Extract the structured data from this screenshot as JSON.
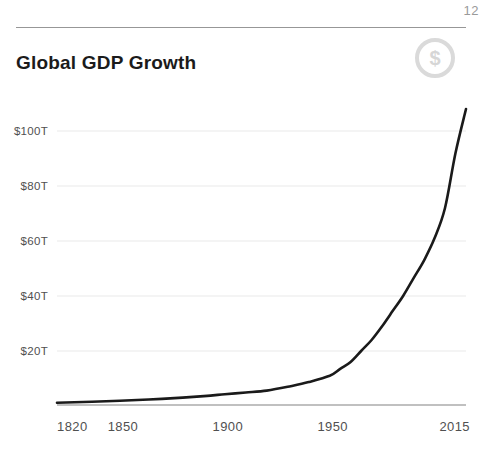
{
  "header": {
    "page_number": "12",
    "title": "Global GDP Growth",
    "dollar_icon_glyph": "$"
  },
  "chart_data": {
    "type": "line",
    "title": "Global GDP Growth",
    "x": [
      1820,
      1850,
      1870,
      1890,
      1900,
      1910,
      1920,
      1930,
      1940,
      1950,
      1955,
      1960,
      1965,
      1970,
      1975,
      1980,
      1985,
      1990,
      1995,
      2000,
      2005,
      2010,
      2015
    ],
    "series": [
      {
        "name": "Global GDP (trillions USD)",
        "values": [
          1.2,
          1.9,
          2.6,
          3.6,
          4.3,
          4.9,
          5.6,
          7.0,
          8.7,
          11,
          13.5,
          16,
          20,
          24,
          29,
          34.5,
          40,
          46.5,
          53,
          61,
          72,
          92,
          108
        ]
      }
    ],
    "xlim": [
      1820,
      2015
    ],
    "ylim": [
      0,
      110
    ],
    "yticks": [
      20,
      40,
      60,
      80,
      100
    ],
    "ytick_labels": [
      "$20T",
      "$40T",
      "$60T",
      "$80T",
      "$100T"
    ],
    "xticks": [
      1820,
      1850,
      1900,
      1950,
      2015
    ],
    "xtick_labels": [
      "1820",
      "1850",
      "1900",
      "1950",
      "2015"
    ],
    "grid": "horizontal",
    "legend": "none",
    "colors": {
      "line": "#1a1a1a",
      "gridline": "#e9e9e9",
      "axis_line": "#ababab",
      "tick_label": "#505050"
    }
  }
}
